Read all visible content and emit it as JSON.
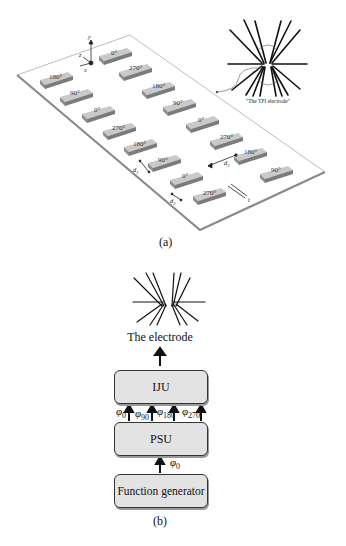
{
  "figure_a": {
    "caption": "(a)",
    "axes": {
      "y": "y",
      "z": "z",
      "x": "x"
    },
    "electrode_label": "\"The TPI electrode\"",
    "dimension_labels": {
      "d1": "d",
      "d1_sub": "1",
      "d2": "d",
      "d2_sub": "2",
      "d3": "d",
      "d3_sub": "3",
      "t": "t"
    },
    "left_column_pads": [
      "180°",
      "90°",
      "0°",
      "270°",
      "180°",
      "90°",
      "0°",
      "270°"
    ],
    "middle_column_pads": [
      "0°",
      "270°",
      "180°",
      "90°",
      "0°",
      "270°",
      "180°"
    ],
    "right_column_pads": [
      "90°"
    ]
  },
  "figure_b": {
    "caption": "(b)",
    "electrode_label": "The electrode",
    "blocks": {
      "iju": "IJU",
      "psu": "PSU",
      "function_generator": "Function generator"
    },
    "phases": [
      {
        "symbol": "φ",
        "sub": "0"
      },
      {
        "symbol": "φ",
        "sub": "90"
      },
      {
        "symbol": "φ",
        "sub": "180"
      },
      {
        "symbol": "φ",
        "sub": "270"
      }
    ],
    "input_phase": {
      "symbol": "φ",
      "sub": "0"
    }
  },
  "colors": {
    "pad": "#b8b8b8",
    "pad_top": "#c9c9c9",
    "plate": "#ffffff",
    "plate_edge": "#9a9a9a",
    "block_fill": "#e3e3e3"
  }
}
